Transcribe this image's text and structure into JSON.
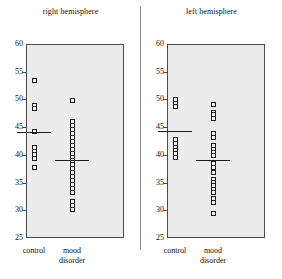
{
  "figure": {
    "divider_name": "panel-divider"
  },
  "chart_data": {
    "type": "scatter",
    "title": "",
    "xlabel": "",
    "ylabel": "",
    "ylim": [
      25,
      60
    ],
    "yticks": [
      25,
      30,
      35,
      40,
      45,
      50,
      55,
      60
    ],
    "ytick_labels": [
      "25",
      "30",
      "35",
      "40",
      "45",
      "50",
      "55",
      "60"
    ],
    "grid": false,
    "legend": "none",
    "marker": "open-square",
    "panels": [
      {
        "name": "right-hemisphere",
        "title": "right hemisphere",
        "groups": [
          {
            "name": "control",
            "label": "control",
            "label_line2": "",
            "mean": 44.2,
            "values": [
              53.4,
              48.9,
              48.3,
              44.2,
              41.3,
              40.6,
              40.0,
              39.4,
              37.8
            ]
          },
          {
            "name": "mood-disorder",
            "label": "mood",
            "label_line2": "disorder",
            "mean": 39.0,
            "values": [
              49.8,
              46.1,
              45.3,
              44.6,
              43.9,
              43.1,
              42.4,
              41.7,
              41.0,
              40.3,
              39.6,
              38.9,
              38.2,
              37.5,
              36.8,
              36.1,
              35.4,
              34.7,
              34.0,
              33.2,
              31.6,
              30.9,
              30.2
            ]
          }
        ]
      },
      {
        "name": "left-hemisphere",
        "title": "left hemisphere",
        "groups": [
          {
            "name": "control",
            "label": "control",
            "label_line2": "",
            "mean": 44.3,
            "values": [
              49.9,
              49.2,
              48.7,
              42.7,
              42.0,
              41.4,
              40.8,
              40.2,
              39.5
            ]
          },
          {
            "name": "mood-disorder",
            "label": "mood",
            "label_line2": "disorder",
            "mean": 39.1,
            "values": [
              49.1,
              47.7,
              47.2,
              46.6,
              43.8,
              43.1,
              41.6,
              41.0,
              40.4,
              39.8,
              38.4,
              37.7,
              36.8,
              35.5,
              35.0,
              34.4,
              33.8,
              33.2,
              32.1,
              31.4,
              29.4
            ]
          }
        ]
      }
    ]
  }
}
